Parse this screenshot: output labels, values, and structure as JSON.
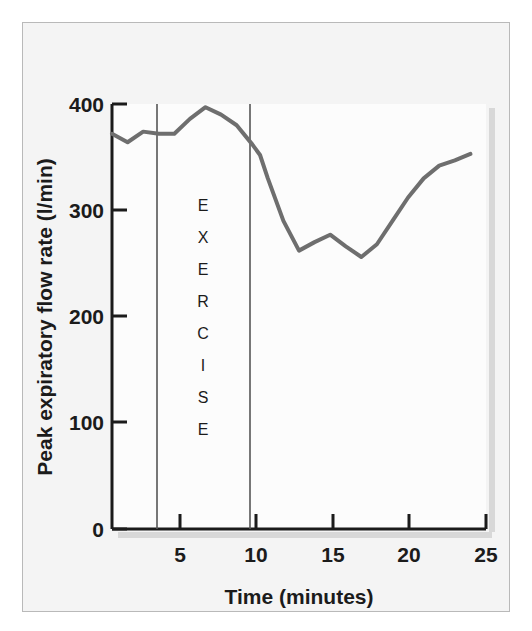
{
  "figure": {
    "background_color": "#f4f4f4",
    "frame_color": "#b9b9b9",
    "axis_color": "#1b1b1b",
    "series_color": "#6e6e6e",
    "annotation_line_color": "#555555",
    "shadow_color": "#d8d8d8"
  },
  "chart_data": {
    "type": "line",
    "title": "",
    "subtitle": "",
    "xlabel": "Time (minutes)",
    "ylabel": "Peak expiratory flow rate (l/min)",
    "xlim": [
      1,
      25
    ],
    "ylim": [
      0,
      400
    ],
    "xticks": [
      5,
      10,
      15,
      20,
      25
    ],
    "xtick_labels": [
      "5",
      "10",
      "15",
      "20",
      "25"
    ],
    "yticks": [
      0,
      100,
      200,
      300,
      400
    ],
    "ytick_labels": [
      "0",
      "100",
      "200",
      "300",
      "400"
    ],
    "grid": false,
    "legend": false,
    "legend_position": "none",
    "series": [
      {
        "name": "Peak expiratory flow rate",
        "color": "#6e6e6e",
        "x": [
          1,
          2,
          3,
          4,
          5,
          6,
          7,
          8,
          9,
          10,
          10.5,
          11,
          12,
          13,
          14,
          15,
          16,
          17,
          18,
          19,
          20,
          21,
          22,
          23,
          24
        ],
        "values": [
          372,
          364,
          374,
          372,
          372,
          386,
          397,
          390,
          380,
          362,
          352,
          330,
          290,
          262,
          270,
          277,
          266,
          256,
          268,
          290,
          312,
          330,
          342,
          347,
          353
        ]
      }
    ],
    "annotations": [
      {
        "name": "exercise-band",
        "label": "EXERCISE",
        "letters": [
          "E",
          "X",
          "E",
          "R",
          "C",
          "I",
          "S",
          "E"
        ],
        "start_x": 3.5,
        "end_x": 9.7,
        "orientation": "vertical-stacked"
      }
    ]
  }
}
